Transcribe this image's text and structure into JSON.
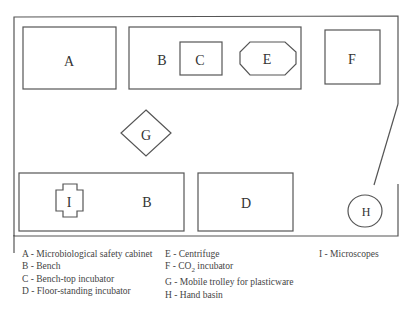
{
  "diagram": {
    "type": "laboratory floor plan",
    "items": {
      "A": "A",
      "B_top": "B",
      "C": "C",
      "E": "E",
      "F": "F",
      "G": "G",
      "I": "I",
      "B_bottom": "B",
      "D": "D",
      "H": "H"
    }
  },
  "legend": {
    "col1": [
      "A - Microbiological safety cabinet",
      "B - Bench",
      "C - Bench-top incubator",
      "D - Floor-standing incubator"
    ],
    "col2": [
      "E - Centrifuge",
      "F - CO",
      "G - Mobile trolley for plasticware",
      "H - Hand basin"
    ],
    "col2_f_sub": "2",
    "col2_f_rest": " incubator",
    "col3": [
      "I - Microscopes"
    ]
  }
}
